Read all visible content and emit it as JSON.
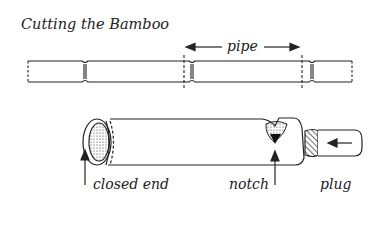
{
  "title": "Cutting the Bamboo",
  "labels": {
    "pipe": "pipe",
    "closed_end": "closed end",
    "notch": "notch",
    "plug": "plug"
  },
  "colors": {
    "line": "#222222",
    "background": "#ffffff"
  }
}
